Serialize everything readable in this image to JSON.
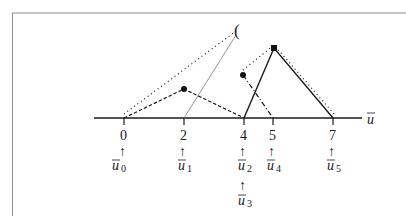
{
  "figure": {
    "axis_label": "u",
    "axis_label_bar": true,
    "ticks": [
      {
        "value": "0",
        "x": 124,
        "knots": [
          {
            "sym": "u",
            "sub": "0"
          }
        ]
      },
      {
        "value": "2",
        "x": 184,
        "knots": [
          {
            "sym": "u",
            "sub": "1"
          }
        ]
      },
      {
        "value": "4",
        "x": 244,
        "knots": [
          {
            "sym": "u",
            "sub": "2"
          },
          {
            "sym": "u",
            "sub": "3"
          }
        ]
      },
      {
        "value": "5",
        "x": 273,
        "knots": [
          {
            "sym": "u",
            "sub": "4"
          }
        ]
      },
      {
        "value": "7",
        "x": 333,
        "knots": [
          {
            "sym": "u",
            "sub": "5"
          }
        ]
      }
    ],
    "marker_glyph": "(",
    "colors": {
      "ink": "#1a1a1a",
      "grey_line": "#8a8a8a",
      "frame": "#8c8c8c"
    },
    "labels": {
      "t0": "0",
      "t2": "2",
      "t4": "4",
      "t5": "5",
      "t7": "7",
      "u": "u",
      "s0": "0",
      "s1": "1",
      "s2": "2",
      "s3": "3",
      "s4": "4",
      "s5": "5",
      "arrow": "↑",
      "glyph": "("
    }
  }
}
